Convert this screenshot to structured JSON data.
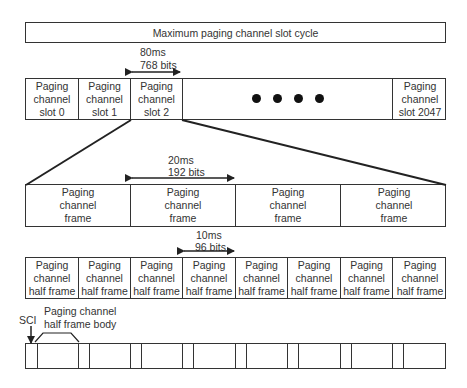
{
  "title": "Maximum paging channel slot cycle",
  "slot_row": {
    "duration": "80ms",
    "bits": "768 bits",
    "slots": [
      {
        "label_1": "Paging",
        "label_2": "channel",
        "label_3": "slot 0"
      },
      {
        "label_1": "Paging",
        "label_2": "channel",
        "label_3": "slot 1"
      },
      {
        "label_1": "Paging",
        "label_2": "channel",
        "label_3": "slot 2"
      },
      {
        "label_1": "Paging",
        "label_2": "channel",
        "label_3": "slot 2047"
      }
    ],
    "ellipsis": "● ● ● ●"
  },
  "frame_row": {
    "duration": "20ms",
    "bits": "192 bits",
    "frames": [
      {
        "label_1": "Paging",
        "label_2": "channel",
        "label_3": "frame"
      },
      {
        "label_1": "Paging",
        "label_2": "channel",
        "label_3": "frame"
      },
      {
        "label_1": "Paging",
        "label_2": "channel",
        "label_3": "frame"
      },
      {
        "label_1": "Paging",
        "label_2": "channel",
        "label_3": "frame"
      }
    ]
  },
  "half_frame_row": {
    "duration": "10ms",
    "bits": "96 bits",
    "half_frames": [
      {
        "label_1": "Paging",
        "label_2": "channel",
        "label_3": "half frame"
      },
      {
        "label_1": "Paging",
        "label_2": "channel",
        "label_3": "half frame"
      },
      {
        "label_1": "Paging",
        "label_2": "channel",
        "label_3": "half frame"
      },
      {
        "label_1": "Paging",
        "label_2": "channel",
        "label_3": "half frame"
      },
      {
        "label_1": "Paging",
        "label_2": "channel",
        "label_3": "half frame"
      },
      {
        "label_1": "Paging",
        "label_2": "channel",
        "label_3": "half frame"
      },
      {
        "label_1": "Paging",
        "label_2": "channel",
        "label_3": "half frame"
      },
      {
        "label_1": "Paging",
        "label_2": "channel",
        "label_3": "half frame"
      }
    ]
  },
  "body_row": {
    "sci_label": "SCI",
    "body_label_1": "Paging channel",
    "body_label_2": "half frame body"
  }
}
